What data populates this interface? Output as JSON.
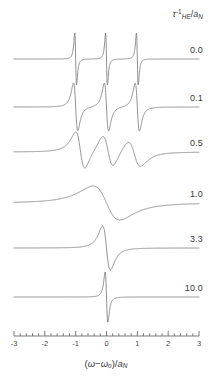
{
  "figure": {
    "legend_title_parts": {
      "tau": "τ",
      "tau_sup": "-1",
      "tau_sub": "HE",
      "slash": "/",
      "a": "a",
      "a_sub": "N"
    },
    "xaxis_title_parts": {
      "open": "(",
      "omega": "ω",
      "minus": "−",
      "omega0": "ω",
      "omega0_sub": "o",
      "close": ")/",
      "a": "a",
      "a_sub": "N"
    },
    "line_color": "#7d7d7d",
    "axis_color": "#6b6b6b",
    "background": "#ffffff"
  },
  "chart_data": {
    "type": "line",
    "title": "",
    "subtitle": "",
    "xlabel": "(ω−ωo)/aN",
    "ylabel": "",
    "xlim": [
      -3,
      3
    ],
    "grid": false,
    "legend_position": "right",
    "legend_title": "τHE^-1/aN",
    "xticks": [
      -3,
      -2,
      -1,
      0,
      1,
      2,
      3
    ],
    "xticklabels": [
      "-3",
      "-2",
      "-1",
      "0",
      "1",
      "2",
      "3"
    ],
    "minor_ticks_per_interval": 4,
    "stacked_offset_traces": true,
    "series": [
      {
        "name": "0.0",
        "label": "0.0",
        "exchange_rate": 0.0,
        "linewidth_param": 0.05,
        "line_positions": [
          -1,
          0,
          1
        ],
        "baseline_y": 59,
        "amplitude": 26,
        "description": "Three sharply resolved first-derivative hyperfine lines at -1, 0, +1"
      },
      {
        "name": "0.1",
        "label": "0.1",
        "exchange_rate": 0.1,
        "linewidth_param": 0.12,
        "line_positions": [
          -1,
          0,
          1
        ],
        "baseline_y": 107,
        "amplitude": 24,
        "description": "Three broadened derivative lines, still resolved"
      },
      {
        "name": "0.5",
        "label": "0.5",
        "exchange_rate": 0.5,
        "linewidth_param": 0.3,
        "line_positions": [
          -0.85,
          0.05,
          0.9
        ],
        "baseline_y": 152,
        "amplitude": 20,
        "description": "Lines broadened and shifted inward, beginning to coalesce, asymmetric"
      },
      {
        "name": "1.0",
        "label": "1.0",
        "exchange_rate": 1.0,
        "linewidth_param": 0.75,
        "line_positions": [
          0
        ],
        "baseline_y": 203,
        "amplitude": 17,
        "description": "Lines collapsed into a single very broad derivative feature"
      },
      {
        "name": "3.3",
        "label": "3.3",
        "exchange_rate": 3.3,
        "linewidth_param": 0.22,
        "line_positions": [
          0
        ],
        "baseline_y": 248,
        "amplitude": 22,
        "description": "Single exchange-narrowed derivative line"
      },
      {
        "name": "10.0",
        "label": "10.0",
        "exchange_rate": 10.0,
        "linewidth_param": 0.075,
        "line_positions": [
          0
        ],
        "baseline_y": 297,
        "amplitude": 25,
        "description": "Single very narrow exchange-narrowed derivative line at zero"
      }
    ]
  }
}
